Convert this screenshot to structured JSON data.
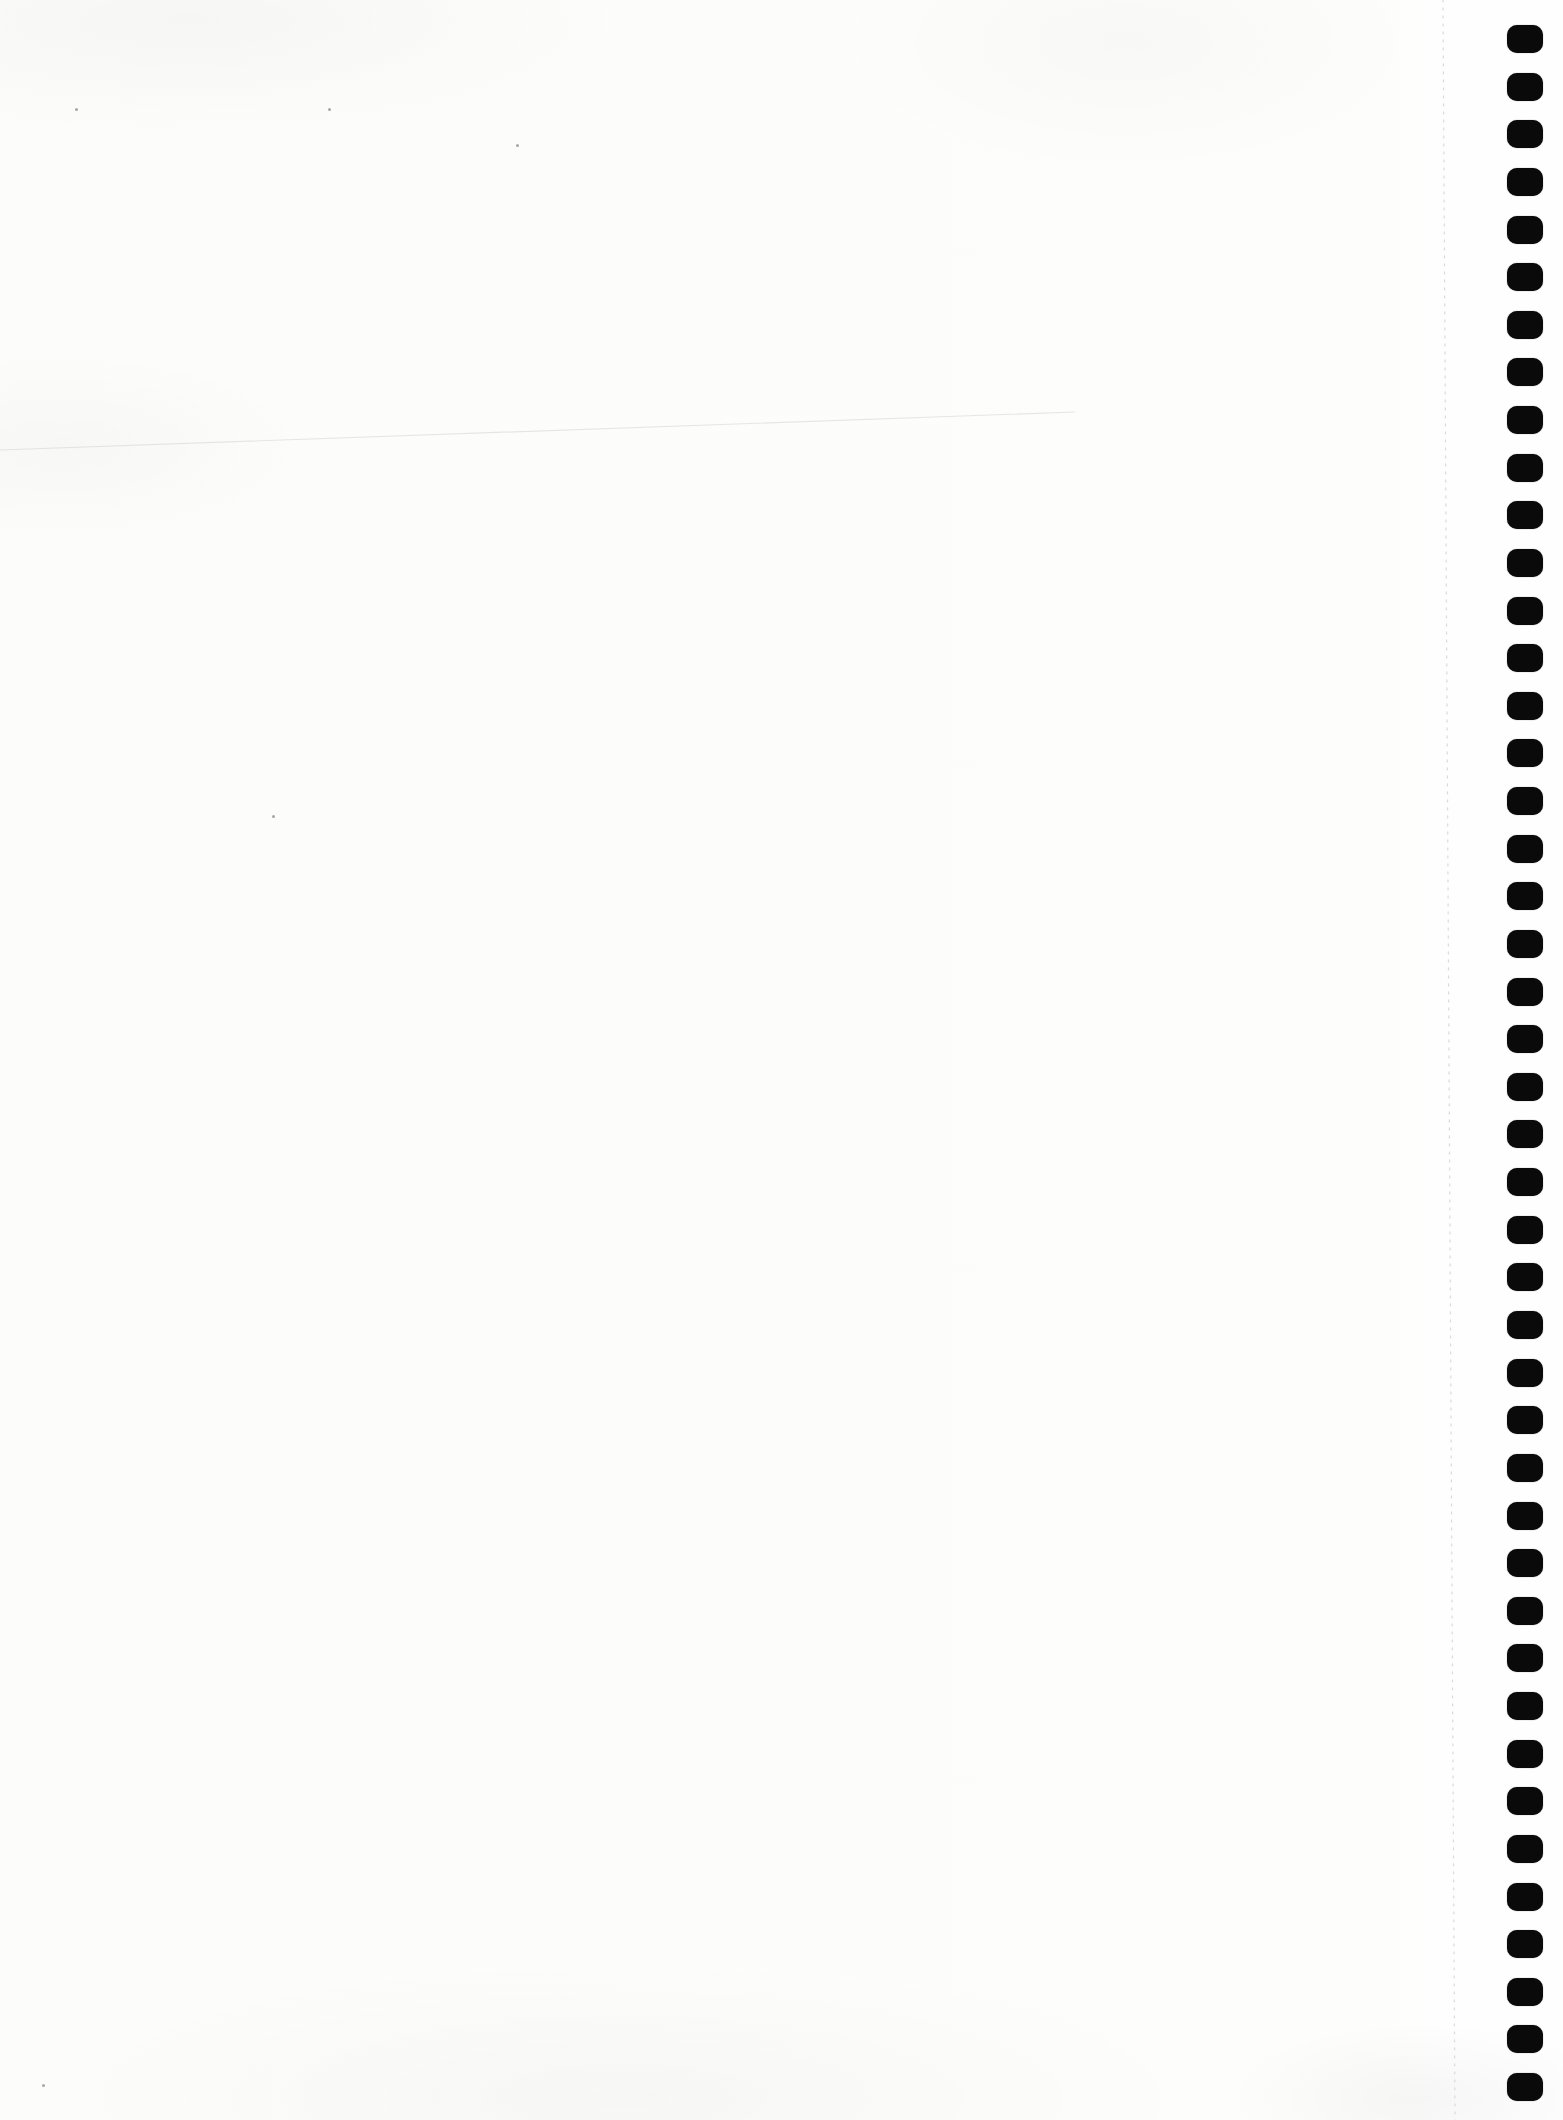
{
  "document": {
    "kind": "scanned blank spiral-bound notebook page",
    "page_text": "",
    "paper_color": "#fcfcfa",
    "right_margin_strip_color": "#fefefe"
  },
  "canvas": {
    "width": 1563,
    "height": 2120
  },
  "binding": {
    "holes": {
      "count": 44,
      "color": "#0a0a0a",
      "center_x": 1525,
      "first_center_y": 39,
      "spacing_y": 47.63,
      "width": 36,
      "height": 28,
      "corner_radius": 10
    },
    "perforation_line": {
      "x_top": 1443,
      "y_top": 0,
      "x_bottom": 1455,
      "y_bottom": 2120,
      "color": "#d8d8d5",
      "dash": "2 6",
      "opacity": 0.85
    }
  },
  "artifacts": {
    "crease_line": {
      "x1": 0,
      "y1": 450,
      "x2": 1075,
      "y2": 412,
      "color": "#bdbdbb",
      "opacity": 0.35
    },
    "speck_color": "rgba(95,95,92,0.55)",
    "specks": [
      {
        "x": 75,
        "y": 108
      },
      {
        "x": 328,
        "y": 108
      },
      {
        "x": 516,
        "y": 144
      },
      {
        "x": 272,
        "y": 815
      },
      {
        "x": 42,
        "y": 2084
      }
    ]
  }
}
